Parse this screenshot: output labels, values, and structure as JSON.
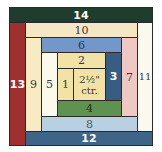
{
  "block": {
    "strips": [
      {
        "id": "14",
        "label": "14",
        "color": "#1e3d2c"
      },
      {
        "id": "13",
        "label": "13",
        "color": "#9e3030"
      },
      {
        "id": "12",
        "label": "12",
        "color": "#3e6488"
      },
      {
        "id": "11",
        "label": "11",
        "color": "#fbf8ee"
      },
      {
        "id": "10",
        "label": "10",
        "color": "#f5e6c4"
      },
      {
        "id": "9",
        "label": "9",
        "color": "#f7ebc4"
      },
      {
        "id": "8",
        "label": "8",
        "color": "#b9cfe2"
      },
      {
        "id": "7",
        "label": "7",
        "color": "#efc7c3"
      },
      {
        "id": "6",
        "label": "6",
        "color": "#7497c9"
      },
      {
        "id": "5",
        "label": "5",
        "color": "#fbf8ec"
      },
      {
        "id": "4",
        "label": "4",
        "color": "#5f9150"
      },
      {
        "id": "3",
        "label": "3",
        "color": "#375e82"
      },
      {
        "id": "2",
        "label": "2",
        "color": "#f3e2a6"
      },
      {
        "id": "1",
        "label": "1",
        "color": "#f3e2a6"
      }
    ],
    "center": {
      "line1": "2½\"",
      "line2": "ctr.",
      "color": "#f3e2a6"
    }
  }
}
